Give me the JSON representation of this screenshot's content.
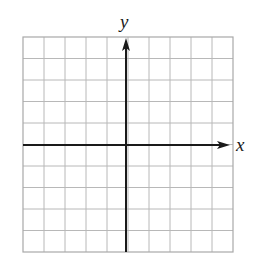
{
  "diagram": {
    "type": "coordinate-grid",
    "grid": {
      "columns": 10,
      "rows": 10,
      "left": 23,
      "top": 37,
      "right": 233,
      "bottom": 252,
      "line_color": "#b8b8b8",
      "border_color": "#a8a8a8"
    },
    "axes": {
      "color": "#1a1a1a",
      "x_axis": {
        "label": "x",
        "y": 145,
        "from": 23,
        "to": 230
      },
      "y_axis": {
        "label": "y",
        "x": 126,
        "from": 252,
        "to": 38
      }
    }
  }
}
